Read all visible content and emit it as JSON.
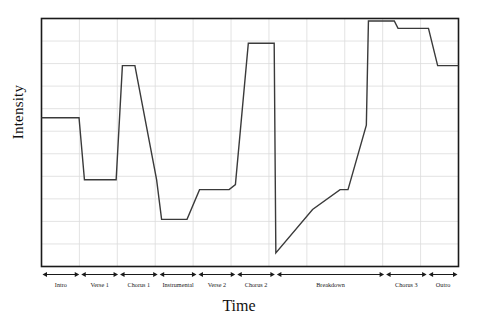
{
  "chart_data": {
    "type": "line",
    "title": "",
    "xlabel": "Time",
    "ylabel": "Intensity",
    "grid": true,
    "legend": null,
    "xlim": [
      0,
      100
    ],
    "ylim": [
      0,
      10
    ],
    "axis_tick_labels": {
      "x": [],
      "y": []
    },
    "line_color": "#3a3a3a",
    "grid_color": "#dcdcdc",
    "axis_color": "#1a1a1a",
    "background": "#ffffff",
    "sections": [
      {
        "label": "Intro",
        "x_start": 0.0,
        "x_end": 9.3
      },
      {
        "label": "Verse 1",
        "x_start": 9.3,
        "x_end": 18.6
      },
      {
        "label": "Chorus 1",
        "x_start": 18.6,
        "x_end": 28.1
      },
      {
        "label": "Instrumental",
        "x_start": 28.1,
        "x_end": 37.4
      },
      {
        "label": "Verse 2",
        "x_start": 37.4,
        "x_end": 46.7
      },
      {
        "label": "Chorus 2",
        "x_start": 46.7,
        "x_end": 56.2
      },
      {
        "label": "Breakdown",
        "x_start": 56.2,
        "x_end": 82.4
      },
      {
        "label": "Chorus 3",
        "x_start": 82.4,
        "x_end": 92.6
      },
      {
        "label": "Outro",
        "x_start": 92.6,
        "x_end": 100.0
      }
    ],
    "x": [
      0.0,
      9.0,
      10.3,
      17.9,
      19.4,
      22.4,
      27.6,
      28.8,
      33.4,
      34.9,
      37.9,
      45.0,
      46.5,
      49.6,
      55.8,
      56.2,
      65.0,
      71.6,
      73.5,
      77.9,
      78.4,
      84.6,
      85.5,
      92.0,
      92.8,
      95.0,
      100.0
    ],
    "values": [
      6.0,
      6.0,
      3.5,
      3.5,
      8.1,
      8.1,
      3.5,
      1.9,
      1.9,
      1.9,
      3.1,
      3.1,
      3.3,
      9.0,
      9.0,
      0.55,
      2.3,
      3.1,
      3.1,
      5.7,
      9.9,
      9.9,
      9.6,
      9.6,
      9.6,
      8.1,
      8.1
    ],
    "series": [
      {
        "name": "Intensity",
        "points": [
          {
            "x": 0.0,
            "y": 6.0
          },
          {
            "x": 9.0,
            "y": 6.0
          },
          {
            "x": 10.3,
            "y": 3.5
          },
          {
            "x": 17.9,
            "y": 3.5
          },
          {
            "x": 19.4,
            "y": 8.1
          },
          {
            "x": 22.4,
            "y": 8.1
          },
          {
            "x": 27.6,
            "y": 3.5
          },
          {
            "x": 28.8,
            "y": 1.9
          },
          {
            "x": 33.4,
            "y": 1.9
          },
          {
            "x": 34.9,
            "y": 1.9
          },
          {
            "x": 37.9,
            "y": 3.1
          },
          {
            "x": 45.0,
            "y": 3.1
          },
          {
            "x": 46.5,
            "y": 3.3
          },
          {
            "x": 49.6,
            "y": 9.0
          },
          {
            "x": 55.8,
            "y": 9.0
          },
          {
            "x": 56.2,
            "y": 0.55
          },
          {
            "x": 65.0,
            "y": 2.3
          },
          {
            "x": 71.6,
            "y": 3.1
          },
          {
            "x": 73.5,
            "y": 3.1
          },
          {
            "x": 77.9,
            "y": 5.7
          },
          {
            "x": 78.4,
            "y": 9.9
          },
          {
            "x": 84.6,
            "y": 9.9
          },
          {
            "x": 85.5,
            "y": 9.6
          },
          {
            "x": 92.0,
            "y": 9.6
          },
          {
            "x": 92.8,
            "y": 9.6
          },
          {
            "x": 95.0,
            "y": 8.1
          },
          {
            "x": 100.0,
            "y": 8.1
          }
        ]
      }
    ],
    "annotations": [
      "Intensity rises and falls with each arrangement section",
      "Sharp drop to minimum at the start of the Breakdown",
      "Gradual build through the Breakdown into the highest peak at Chorus 3"
    ]
  }
}
